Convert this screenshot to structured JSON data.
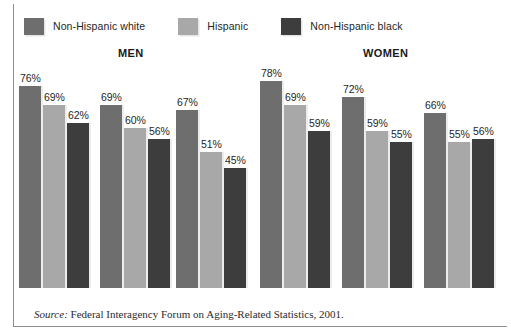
{
  "legend": {
    "items": [
      {
        "label": "Non-Hispanic white",
        "color": "#6e6e6e",
        "key": "non-hispanic-white"
      },
      {
        "label": "Hispanic",
        "color": "#a8a8a8",
        "key": "hispanic"
      },
      {
        "label": "Non-Hispanic black",
        "color": "#3d3d3d",
        "key": "non-hispanic-black"
      }
    ]
  },
  "panels": [
    {
      "title": "MEN",
      "key": "men"
    },
    {
      "title": "WOMEN",
      "key": "women"
    }
  ],
  "source": {
    "word": "Source:",
    "text": " Federal Interagency Forum on Aging-Related Statistics, 2001."
  },
  "chart_data": {
    "type": "bar",
    "title": "",
    "xlabel": "",
    "ylabel": "",
    "ylim": [
      0,
      85
    ],
    "grid": false,
    "legend_position": "top-left",
    "value_suffix": "%",
    "panels": [
      {
        "name": "MEN",
        "categories": [
          "65 to 74",
          "75 to 84",
          "85 or Older"
        ],
        "series": [
          {
            "name": "Non-Hispanic white",
            "color": "#6e6e6e",
            "values": [
              76,
              69,
              67
            ]
          },
          {
            "name": "Hispanic",
            "color": "#a8a8a8",
            "values": [
              69,
              60,
              51
            ]
          },
          {
            "name": "Non-Hispanic black",
            "color": "#3d3d3d",
            "values": [
              62,
              56,
              45
            ]
          }
        ]
      },
      {
        "name": "WOMEN",
        "categories": [
          "65 and over",
          "65 and over",
          "65 and over"
        ],
        "series": [
          {
            "name": "Non-Hispanic white",
            "color": "#6e6e6e",
            "values": [
              78,
              72,
              66
            ]
          },
          {
            "name": "Hispanic",
            "color": "#a8a8a8",
            "values": [
              69,
              59,
              55
            ]
          },
          {
            "name": "Non-Hispanic black",
            "color": "#3d3d3d",
            "values": [
              59,
              55,
              56
            ]
          }
        ]
      }
    ],
    "labels": {
      "men": [
        [
          "76%",
          "69%",
          "62%"
        ],
        [
          "69%",
          "60%",
          "56%"
        ],
        [
          "67%",
          "51%",
          "45%"
        ]
      ],
      "women": [
        [
          "78%",
          "69%",
          "59%"
        ],
        [
          "72%",
          "59%",
          "55%"
        ],
        [
          "66%",
          "55%",
          "56%"
        ]
      ]
    }
  }
}
